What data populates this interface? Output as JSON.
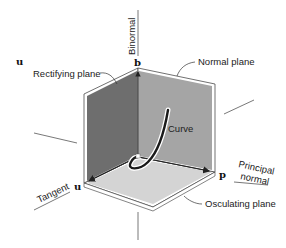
{
  "figure": {
    "colors": {
      "rectifying_plane": "#6e6e6e",
      "normal_plane": "#a3a3a3",
      "osculating_plane": "#d2d2d2",
      "edge": "#ffffff",
      "outline": "#333333",
      "axis_line": "#555555",
      "curve": "#1a1a1a"
    },
    "planes": {
      "rectifying": "Rectifying plane",
      "normal": "Normal plane",
      "osculating": "Osculating plane"
    },
    "axes": {
      "binormal": "Binormal",
      "tangent": "Tangent",
      "principal_normal_line1": "Principal",
      "principal_normal_line2": "normal"
    },
    "vectors": {
      "b": "b",
      "u_corner": "u",
      "u_top_left": "u",
      "p": "p"
    },
    "curve_label": "Curve"
  }
}
